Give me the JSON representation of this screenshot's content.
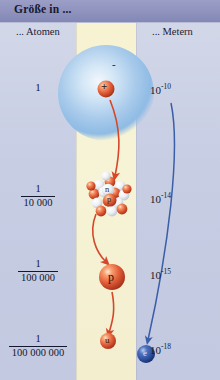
{
  "header": {
    "title": "Größe in ..."
  },
  "columns": {
    "left_label": "... Atomen",
    "right_label": "... Metern"
  },
  "scale_rows": [
    {
      "atoms_numerator": "1",
      "atoms_denominator": "",
      "atoms_plain": "1",
      "meters_mantissa": "10",
      "meters_exponent": "-10",
      "object": "atom",
      "object_label": "+",
      "secondary_label": "-"
    },
    {
      "atoms_numerator": "1",
      "atoms_denominator": "10 000",
      "atoms_plain": "",
      "meters_mantissa": "10",
      "meters_exponent": "-14",
      "object": "nucleus",
      "object_label": "p",
      "secondary_label": "n"
    },
    {
      "atoms_numerator": "1",
      "atoms_denominator": "100 000",
      "atoms_plain": "",
      "meters_mantissa": "10",
      "meters_exponent": "-15",
      "object": "proton",
      "object_label": "p",
      "secondary_label": ""
    },
    {
      "atoms_numerator": "1",
      "atoms_denominator": "100 000 000",
      "atoms_plain": "",
      "meters_mantissa": "10",
      "meters_exponent": "-18",
      "object": "quark",
      "object_label": "u",
      "secondary_label": "e"
    }
  ],
  "particles": {
    "atom_charge": "+",
    "atom_electron_mark": "-",
    "nucleus_neutron": "n",
    "nucleus_proton": "p",
    "proton": "p",
    "quark": "u",
    "electron": "e"
  },
  "colors": {
    "header_band": "#8e92bd",
    "panel_left": "#c7cde3",
    "panel_center": "#f6f2d2",
    "electron_cloud": "#9fc4e8",
    "proton_red": "#e4603a",
    "electron_blue": "#2e4f9e",
    "red_arrow": "#d6472a",
    "blue_arrow": "#3b5ea8",
    "text": "#14182f"
  }
}
